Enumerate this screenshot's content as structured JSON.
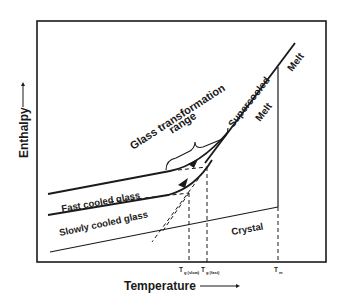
{
  "diagram": {
    "axes": {
      "x_label": "Temperature",
      "y_label": "Enthalpy",
      "x_ticks": [
        {
          "main": "T",
          "sub": "g (slow)"
        },
        {
          "main": "T",
          "sub": "g (fast)"
        },
        {
          "main": "T",
          "sub": "m"
        }
      ]
    },
    "labels": {
      "melt_upper": "Melt",
      "supercooled": "Supercooled",
      "melt_lower": "Melt",
      "glass_transformation": "Glass transformation",
      "range": "range",
      "fast_cooled_glass": "Fast cooled glass",
      "slowly_cooled_glass": "Slowly cooled glass",
      "crystal": "Crystal"
    },
    "colors": {
      "line": "#1a1a1a",
      "background": "#ffffff"
    }
  }
}
